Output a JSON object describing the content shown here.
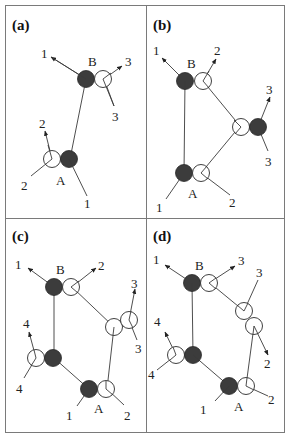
{
  "figure": {
    "panels": [
      {
        "id": "a",
        "label": "(a)",
        "nodes": {
          "B": "B",
          "A": "A"
        },
        "vector_labels": [
          "1",
          "3",
          "3",
          "2",
          "2",
          "1"
        ]
      },
      {
        "id": "b",
        "label": "(b)",
        "nodes": {
          "B": "B",
          "A": "A"
        },
        "vector_labels": [
          "1",
          "2",
          "3",
          "3",
          "1",
          "2"
        ]
      },
      {
        "id": "c",
        "label": "(c)",
        "nodes": {
          "B": "B",
          "A": "A"
        },
        "vector_labels": [
          "1",
          "2",
          "3",
          "3",
          "4",
          "4",
          "1",
          "2"
        ]
      },
      {
        "id": "d",
        "label": "(d)",
        "nodes": {
          "B": "B",
          "A": "A"
        },
        "vector_labels": [
          "1",
          "3",
          "3",
          "2",
          "4",
          "4",
          "1",
          "2"
        ]
      }
    ],
    "colors": {
      "filled_circle": "#3c3c3c",
      "open_circle": "#ffffff",
      "line": "#3a3a3a",
      "frame": "#7a7a7a"
    }
  }
}
